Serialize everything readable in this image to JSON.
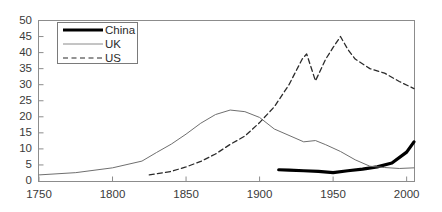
{
  "chart_data": {
    "type": "line",
    "title": "",
    "xlabel": "",
    "ylabel": "",
    "xlim": [
      1750,
      2005
    ],
    "ylim": [
      0,
      50
    ],
    "grid": false,
    "legend_position": "top-left",
    "xticks": [
      1750,
      1800,
      1850,
      1900,
      1950,
      2000
    ],
    "yticks": [
      0,
      5,
      10,
      15,
      20,
      25,
      30,
      35,
      40,
      45,
      50
    ],
    "series": [
      {
        "name": "China",
        "style": "solid-thick",
        "color": "#000000",
        "x": [
          1913,
          1920,
          1930,
          1940,
          1950,
          1960,
          1970,
          1980,
          1990,
          2000,
          2005
        ],
        "y": [
          3.5,
          3.4,
          3.2,
          3.0,
          2.6,
          3.2,
          3.7,
          4.4,
          5.6,
          9.0,
          12.2
        ]
      },
      {
        "name": "UK",
        "style": "solid-thin",
        "color": "#6f6f6f",
        "x": [
          1750,
          1775,
          1800,
          1820,
          1830,
          1840,
          1850,
          1860,
          1870,
          1880,
          1890,
          1900,
          1910,
          1920,
          1930,
          1938,
          1945,
          1955,
          1965,
          1975,
          1985,
          1995,
          2005
        ],
        "y": [
          1.9,
          2.6,
          4.1,
          6.2,
          8.9,
          11.5,
          14.6,
          18.0,
          20.7,
          22.1,
          21.6,
          19.8,
          16.2,
          14.2,
          12.2,
          12.6,
          11.3,
          9.2,
          6.6,
          4.6,
          4.2,
          3.9,
          4.1
        ]
      },
      {
        "name": "US",
        "style": "dashed",
        "color": "#2b2b2b",
        "x": [
          1825,
          1840,
          1850,
          1860,
          1870,
          1880,
          1890,
          1900,
          1910,
          1920,
          1929,
          1932,
          1938,
          1945,
          1950,
          1955,
          1960,
          1965,
          1975,
          1985,
          1995,
          2005
        ],
        "y": [
          1.9,
          3.0,
          4.4,
          6.1,
          8.4,
          11.4,
          14.0,
          18.2,
          23.1,
          30.0,
          38.0,
          39.6,
          31.2,
          38.0,
          41.6,
          45.0,
          41.0,
          38.0,
          35.0,
          33.6,
          31.0,
          28.8
        ]
      }
    ],
    "legend_entries": [
      {
        "label": "China"
      },
      {
        "label": "UK"
      },
      {
        "label": "US"
      }
    ]
  }
}
